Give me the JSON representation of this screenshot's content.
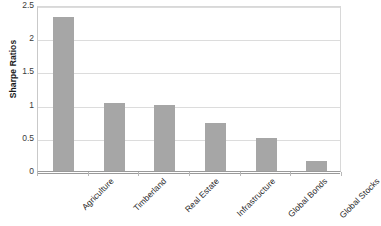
{
  "chart_data": {
    "type": "bar",
    "title": "",
    "subtitle": "",
    "xlabel": "",
    "ylabel": "Sharpe Ratios",
    "categories": [
      "Agriculture",
      "Timberland",
      "Real Estate",
      "Infrastructure",
      "Global Bonds",
      "Global Stocks"
    ],
    "values": [
      2.32,
      1.02,
      1.0,
      0.72,
      0.49,
      0.15
    ],
    "ylim": [
      0,
      2.5
    ],
    "ytick_labels": [
      "0",
      "0.5",
      "1",
      "1.5",
      "2",
      "2.5"
    ],
    "ytick_values": [
      0,
      0.5,
      1,
      1.5,
      2,
      2.5
    ],
    "grid": true,
    "grid_axis": "y",
    "legend": false,
    "legend_position": "none",
    "bar_color": "#a6a6a6",
    "gridline_color": "#dcdcdc",
    "axis_color": "#9a9a9a",
    "xtick_label_rotation": -45
  },
  "axis": {
    "y_title": "Sharpe Ratios"
  }
}
